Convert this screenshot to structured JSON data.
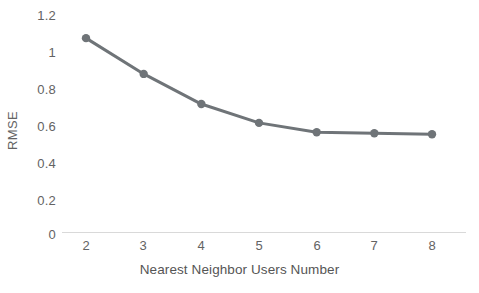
{
  "chart_data": {
    "type": "line",
    "title": "",
    "xlabel": "Nearest Neighbor Users Number",
    "ylabel": "RMSE",
    "x": [
      2,
      3,
      4,
      5,
      6,
      7,
      8
    ],
    "categories": [
      "2",
      "3",
      "4",
      "5",
      "6",
      "7",
      "8"
    ],
    "values": [
      1.04,
      0.85,
      0.69,
      0.59,
      0.54,
      0.535,
      0.53
    ],
    "series": [
      {
        "name": "RMSE",
        "values": [
          1.04,
          0.85,
          0.69,
          0.59,
          0.54,
          0.535,
          0.53
        ]
      }
    ],
    "ylim": [
      0,
      1.2
    ],
    "yticks": [
      0,
      0.2,
      0.4,
      0.6,
      0.8,
      1,
      1.2
    ],
    "ytick_labels": [
      "0",
      "0.2",
      "0.4",
      "0.6",
      "0.8",
      "1",
      "1.2"
    ],
    "xlim": [
      2,
      8
    ],
    "xticks": [
      2,
      3,
      4,
      5,
      6,
      7,
      8
    ],
    "xtick_labels": [
      "2",
      "3",
      "4",
      "5",
      "6",
      "7",
      "8"
    ],
    "grid": false,
    "legend": false,
    "line_color": "#6F7478",
    "marker_color": "#6F7478",
    "axis_color": "#D9D9D9",
    "text_color": "#636363",
    "background": "#FFFFFF",
    "marker": "circle",
    "line_width": 3,
    "marker_size": 6
  }
}
